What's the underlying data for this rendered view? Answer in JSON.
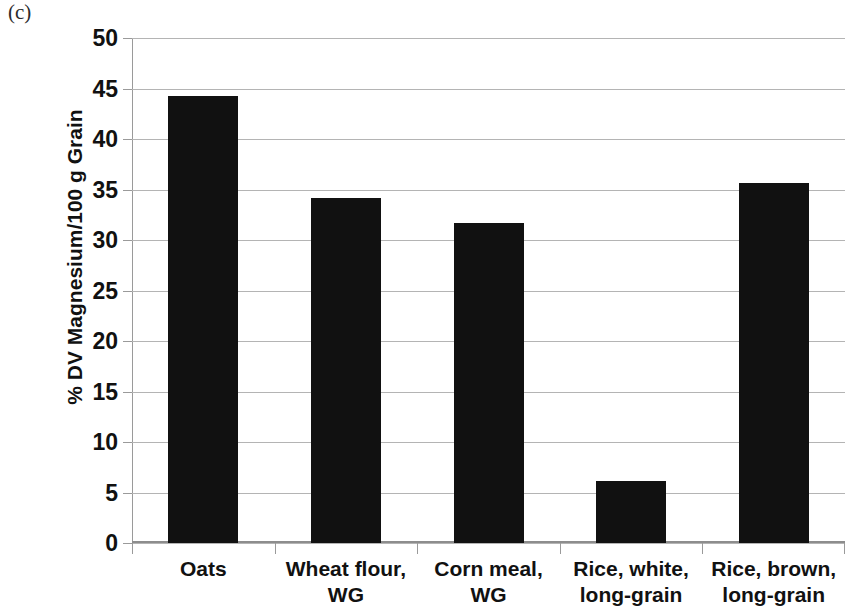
{
  "panel_label": "(c)",
  "colors": {
    "bar": "#111111",
    "gridline": "#b4b4b4",
    "axis": "#9a9a9a",
    "text": "#111111",
    "background": "#ffffff"
  },
  "chart_data": {
    "type": "bar",
    "title": "",
    "panel": "(c)",
    "categories": [
      "Oats",
      "Wheat flour, WG",
      "Corn meal, WG",
      "Rice, white, long-grain",
      "Rice, brown, long-grain"
    ],
    "category_lines": [
      [
        "Oats"
      ],
      [
        "Wheat flour,",
        "WG"
      ],
      [
        "Corn meal,",
        "WG"
      ],
      [
        "Rice, white,",
        "long-grain"
      ],
      [
        "Rice, brown,",
        "long-grain"
      ]
    ],
    "values": [
      44.3,
      34.2,
      31.7,
      6.1,
      35.6
    ],
    "xlabel": "",
    "ylabel": "% DV Magnesium/100 g Grain",
    "ylim": [
      0,
      50
    ],
    "yticks": [
      0,
      5,
      10,
      15,
      20,
      25,
      30,
      35,
      40,
      45,
      50
    ],
    "ytick_labels": [
      "0",
      "5",
      "10",
      "15",
      "20",
      "25",
      "30",
      "35",
      "40",
      "45",
      "50"
    ],
    "grid": true,
    "legend": null,
    "series_color": "#111111"
  }
}
